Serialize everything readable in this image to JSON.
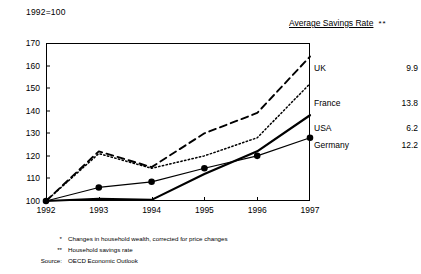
{
  "index_note": "1992=100",
  "legend_header": {
    "text": "Average Savings Rate",
    "marker": "**"
  },
  "legend": [
    {
      "name": "UK",
      "value": "9.9"
    },
    {
      "name": "France",
      "value": "13.8"
    },
    {
      "name": "USA",
      "value": "6.2"
    },
    {
      "name": "Germany",
      "value": "12.2"
    }
  ],
  "footnotes": [
    {
      "mark": "*",
      "text": "Changes in household wealth, corrected for price changes"
    },
    {
      "mark": "**",
      "text": "Household savings rate"
    },
    {
      "mark": "Source:",
      "text": "OECD Economic Outlook"
    }
  ],
  "chart_data": {
    "type": "line",
    "title": "1992=100",
    "xlabel": "",
    "ylabel": "",
    "x": [
      "1992",
      "1993",
      "1994",
      "1995",
      "1996",
      "1997"
    ],
    "categories": [
      "1992",
      "1993",
      "1994",
      "1995",
      "1996",
      "1997"
    ],
    "xlim": [
      1992,
      1997
    ],
    "ylim": [
      100,
      170
    ],
    "yticks": [
      100,
      110,
      120,
      130,
      140,
      150,
      160,
      170
    ],
    "grid": false,
    "legend_position": "right",
    "series": [
      {
        "name": "UK",
        "style": "dashed",
        "marker": "none",
        "savings_rate": 9.9,
        "values": [
          100,
          122,
          115,
          130,
          139,
          164
        ]
      },
      {
        "name": "France",
        "style": "dotted",
        "marker": "none",
        "savings_rate": 13.8,
        "values": [
          100,
          121,
          114.5,
          120,
          128,
          152
        ]
      },
      {
        "name": "USA",
        "style": "solid-thick",
        "marker": "none",
        "savings_rate": 6.2,
        "values": [
          100,
          101,
          100.5,
          112,
          122,
          138
        ]
      },
      {
        "name": "Germany",
        "style": "solid-thin",
        "marker": "circle",
        "savings_rate": 12.2,
        "values": [
          100,
          106,
          108.5,
          114.5,
          120,
          128
        ]
      }
    ]
  }
}
